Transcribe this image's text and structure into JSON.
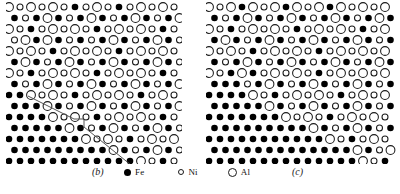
{
  "figure": {
    "kind": "atomic-lattice-schematic",
    "panels": [
      {
        "id": "b",
        "label": "(b)",
        "label_x": 92,
        "label_y": 166,
        "x": 6,
        "y": 2,
        "width": 176,
        "height": 162,
        "has_boundary_line": true,
        "boundary_polyline": "28,96 74,119 84,119 84,127 131,165",
        "boundary_color": "#555555",
        "boundary_width": 1.0
      },
      {
        "id": "c",
        "label": "(c)",
        "label_x": 292,
        "label_y": 166,
        "x": 206,
        "y": 2,
        "width": 190,
        "height": 162,
        "has_boundary_line": false
      }
    ]
  },
  "legend": {
    "items": [
      {
        "key": "fe",
        "glyph": "filled-small-circle",
        "label": "Fe"
      },
      {
        "key": "ni",
        "glyph": "open-small-circle",
        "label": "Ni"
      },
      {
        "key": "al",
        "glyph": "open-large-circle",
        "label": "Al"
      }
    ]
  },
  "colors": {
    "fe_fill": "#000000",
    "open_stroke": "#1a1a1a",
    "background": "#ffffff",
    "boundary": "#555555"
  },
  "lattice": {
    "row_spacing": 11.0,
    "col_spacing": 11.0,
    "row_offset": 5.5,
    "radius_fe": 3.3,
    "radius_ni": 3.0,
    "radius_al": 4.4,
    "note": "hexagonal/close-packed projection; alternating rows offset by half a column"
  },
  "chart_data": {
    "type": "scatter",
    "title": "",
    "xlabel": "",
    "ylabel": "",
    "species": [
      "Fe",
      "Ni",
      "Al"
    ],
    "panel_b": {
      "description": "Fe-rich disordered region lower-left, ordered Ni/Al region upper-right, separated by a stepped antiphase/interphase boundary",
      "rows": [
        "ANANANFNANFNANANA",
        "FNFAFNFAFNFAFNFAF",
        "ANFNANANFNANANFNA",
        "NAFAFNFNFAFNFAFNF",
        "ANANFNANANFNANANA",
        "FAFNFAFNFAFNFAFNF",
        "ANFNANANFNANANFNA",
        "FNFAFNFAFNFAFNFAF",
        "FFANANFNANANFNANA",
        "FFFAFNFAFNFAFNFAF",
        "FFFFANANFNANANFNA",
        "FFFFFAFNFAFNFAFNF",
        "FFFFFFFANANFNANAN",
        "FFFFFFFFFAFNFAFNF",
        "FFFFFFFFFFFFANFNA"
      ],
      "legend_map": {
        "F": "Fe",
        "N": "Ni",
        "A": "Al"
      }
    },
    "panel_c": {
      "description": "Fe-rich disordered region occupying left and lower portion, ordered Ni/Al lattice in upper-right, diffuse (no drawn) boundary",
      "rows": [
        "ANAFANAFANAFANANA",
        "FNFAFNFAFNFAFNFAF",
        "ANFNANANFNANANFNA",
        "FAFNFAFNFAFNFAFNF",
        "ANANFNANANFNANANA",
        "FNFAFNFAFNFAFNFAF",
        "ANFAFNANANFNANANA",
        "FFFNFAFNFAFNFAFNF",
        "FFFFANFNANANFNANA",
        "FFFFFAFNFAFNFAFNF",
        "FFFFFFFANANFNANAN",
        "FFFFFFFFFAFNFAFNF",
        "FFFFFFFFFFFANFNAN",
        "FFFFFFFFFFFFFAFNA",
        "FFFFFFFFFFFFFFANF"
      ],
      "legend_map": {
        "F": "Fe",
        "N": "Ni",
        "A": "Al"
      }
    }
  }
}
